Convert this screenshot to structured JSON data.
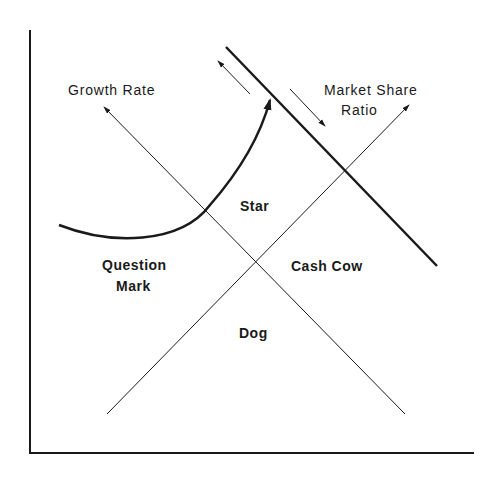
{
  "diagram": {
    "type": "BCG growth-share matrix (rotated)",
    "axis_labels": {
      "growth_rate": "Growth Rate",
      "market_share_line1": "Market Share",
      "market_share_line2": "Ratio"
    },
    "quadrants": {
      "star": "Star",
      "question_mark_line1": "Question",
      "question_mark_line2": "Mark",
      "cash_cow": "Cash Cow",
      "dog": "Dog"
    },
    "colors": {
      "ink": "#1a1a1a",
      "background": "#ffffff"
    }
  }
}
